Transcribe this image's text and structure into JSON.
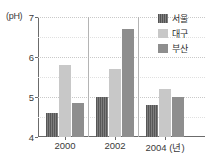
{
  "chart_data": {
    "type": "bar",
    "title": "",
    "xlabel": "년",
    "ylabel": "pH",
    "unit_label": "(pH)",
    "x_axis_suffix": "(년)",
    "categories": [
      "2000",
      "2002",
      "2004"
    ],
    "ylim": [
      4,
      7
    ],
    "yticks": [
      4,
      5,
      6,
      7
    ],
    "ytick_labels": [
      "4",
      "5",
      "6",
      "7"
    ],
    "minor_gridlines": [
      4.5,
      5.5,
      6.5
    ],
    "grid": true,
    "legend_position": "top-right",
    "series": [
      {
        "name": "서울",
        "color": "#6f6f6f",
        "pattern": "vertical-stripes",
        "values": [
          4.6,
          5.0,
          4.8
        ]
      },
      {
        "name": "대구",
        "color": "#c8c8c8",
        "pattern": "solid",
        "values": [
          5.8,
          5.7,
          5.2
        ]
      },
      {
        "name": "부산",
        "color": "#8e8e8e",
        "pattern": "solid",
        "values": [
          4.85,
          6.7,
          5.0
        ]
      }
    ]
  },
  "legend": {
    "items": [
      {
        "label": "서울",
        "swatch_class": "seoul"
      },
      {
        "label": "대구",
        "swatch_class": "daegu"
      },
      {
        "label": "부산",
        "swatch_class": "busan"
      }
    ]
  },
  "axes": {
    "unit_label": "(pH)",
    "y_tick_labels": [
      "7",
      "6",
      "5",
      "4"
    ],
    "x_tick_labels": [
      "2000",
      "2002",
      "2004 (년)"
    ]
  }
}
